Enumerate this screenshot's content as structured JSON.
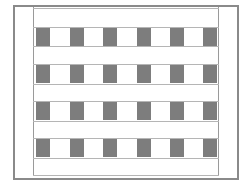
{
  "diagram": {
    "rows": 4,
    "columns": 6,
    "cell_color": "#7d7d7d",
    "border_color": "#8a8a8a",
    "line_color": "#b5b5b5",
    "background": "#ffffff",
    "row_tops": [
      28,
      65,
      102,
      139
    ],
    "row_height": 18,
    "col_lefts": [
      36,
      70,
      103,
      137,
      170,
      203
    ],
    "col_width": 14,
    "hlines": [
      8,
      27,
      46,
      64,
      84,
      101,
      121,
      138,
      158,
      175
    ]
  }
}
